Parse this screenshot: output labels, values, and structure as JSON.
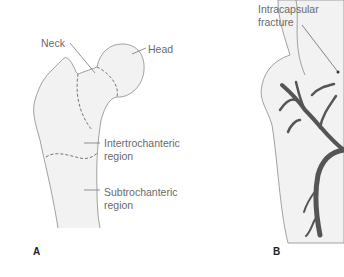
{
  "figure": {
    "panel_a": {
      "letter": "A",
      "labels": {
        "neck": "Neck",
        "head": "Head",
        "intertrochanteric_1": "Intertrochanteric",
        "intertrochanteric_2": "region",
        "subtrochanteric_1": "Subtrochanteric",
        "subtrochanteric_2": "region"
      }
    },
    "panel_b": {
      "letter": "B",
      "labels": {
        "intracapsular_1": "Intracapsular",
        "intracapsular_2": "fracture"
      }
    },
    "colors": {
      "bone_fill": "#f2f2f2",
      "outline": "#8a8a8a",
      "vessel": "#555555",
      "text": "#6a6a6a"
    }
  }
}
